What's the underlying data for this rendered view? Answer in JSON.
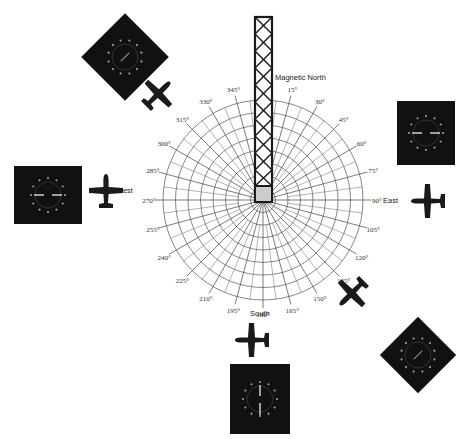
{
  "diagram": {
    "station_label": "Magnetic North",
    "cardinal_labels": {
      "north": "Magnetic North",
      "east": "East",
      "south": "South",
      "west": "West"
    },
    "radial_labels": [
      "0°",
      "15°",
      "30°",
      "45°",
      "60°",
      "75°",
      "90°",
      "105°",
      "120°",
      "135°",
      "150°",
      "165°",
      "180°",
      "195°",
      "210°",
      "225°",
      "240°",
      "255°",
      "270°",
      "285°",
      "300°",
      "315°",
      "330°",
      "345°"
    ],
    "radial_step_degrees": 15,
    "ring_count": 8,
    "instruments": [
      {
        "id": "gauge-northwest",
        "position": "top-left",
        "rotated": true
      },
      {
        "id": "gauge-east",
        "position": "right",
        "rotated": false
      },
      {
        "id": "gauge-west",
        "position": "left",
        "rotated": false
      },
      {
        "id": "gauge-south",
        "position": "bottom",
        "rotated": false
      },
      {
        "id": "gauge-southeast",
        "position": "bottom-right",
        "rotated": true
      }
    ],
    "aircraft": [
      {
        "id": "plane-northwest",
        "position": "top-left",
        "heading_deg": 45
      },
      {
        "id": "plane-west",
        "position": "left",
        "heading_deg": 0
      },
      {
        "id": "plane-east",
        "position": "right",
        "heading_deg": 270
      },
      {
        "id": "plane-southeast",
        "position": "bottom-right",
        "heading_deg": 225
      },
      {
        "id": "plane-south",
        "position": "bottom",
        "heading_deg": 270
      }
    ],
    "colors": {
      "ink": "#1a1a1a",
      "grid": "#555555",
      "gauge_bg": "#111111",
      "tower_fill": "#cccccc"
    }
  }
}
